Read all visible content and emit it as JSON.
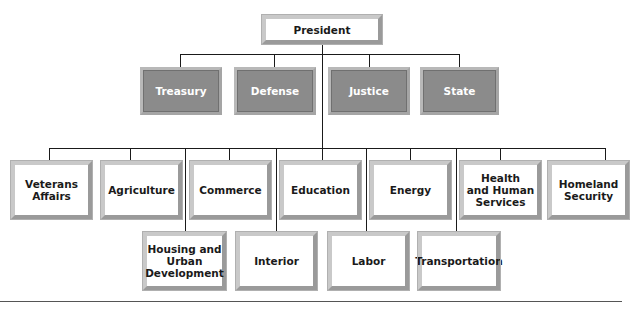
{
  "chart": {
    "root": {
      "label": "President"
    },
    "cabinet_core": [
      {
        "label": "Treasury"
      },
      {
        "label": "Defense"
      },
      {
        "label": "Justice"
      },
      {
        "label": "State"
      }
    ],
    "departments_row1": [
      {
        "label": "Veterans\nAffairs"
      },
      {
        "label": "Agriculture"
      },
      {
        "label": "Commerce"
      },
      {
        "label": "Education"
      },
      {
        "label": "Energy"
      },
      {
        "label": "Health\nand Human\nServices"
      },
      {
        "label": "Homeland\nSecurity"
      }
    ],
    "departments_row2": [
      {
        "label": "Housing and\nUrban\nDevelopment"
      },
      {
        "label": "Interior"
      },
      {
        "label": "Labor"
      },
      {
        "label": "Transportation"
      }
    ]
  },
  "colors": {
    "core_box_fill": "#8b8b8b",
    "box_fill": "#ffffff",
    "line": "#1a1a1a"
  }
}
